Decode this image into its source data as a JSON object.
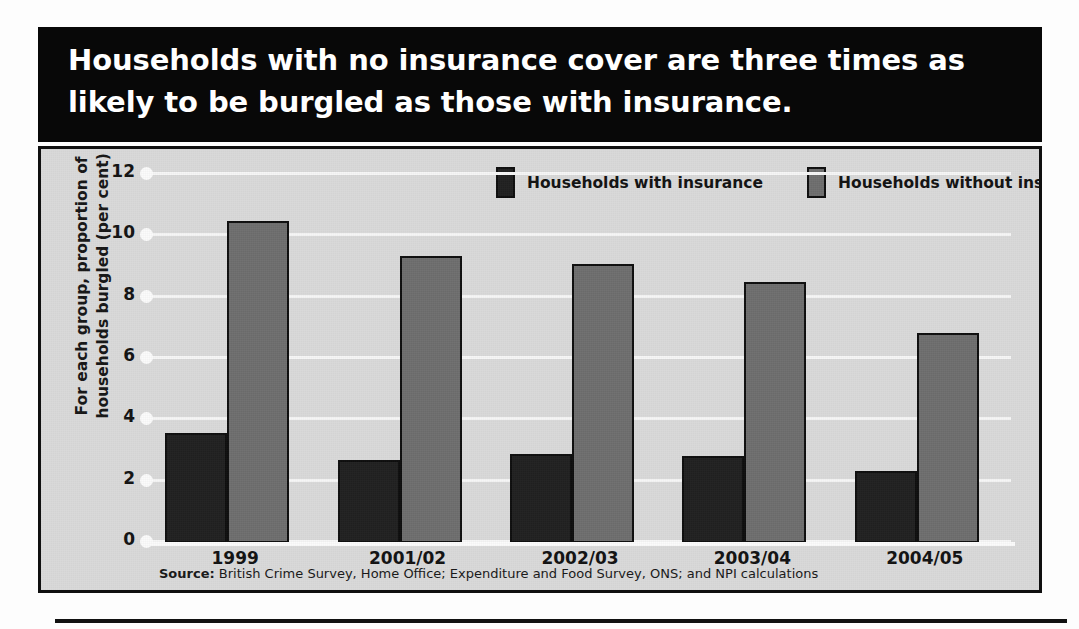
{
  "title": "Households with no insurance cover are three times as likely to be burgled as those with insurance.",
  "source": {
    "prefix": "Source:",
    "text": " British Crime Survey, Home Office; Expenditure and Food Survey, ONS; and NPI calculations"
  },
  "colors": {
    "with_insurance": "#1f1f1f",
    "without_insurance": "#6e6e6e",
    "plot_background": "#d9d9d9",
    "title_band": "#080808",
    "gridline": "#f6f6f6"
  },
  "chart_data": {
    "type": "bar",
    "title": "Households with no insurance cover are three times as likely to be burgled as those with insurance.",
    "xlabel": "",
    "ylabel": "For each group, proportion of households burgled (per cent)",
    "ylim": [
      0,
      12
    ],
    "yticks": [
      0,
      2,
      4,
      6,
      8,
      10,
      12
    ],
    "ytick_labels": [
      "0",
      "2",
      "4",
      "6",
      "8",
      "10",
      "12"
    ],
    "grid": true,
    "legend_position": "top-center",
    "categories": [
      "1999",
      "2001/02",
      "2002/03",
      "2003/04",
      "2004/05"
    ],
    "series": [
      {
        "name": "Households with insurance",
        "color": "#1f1f1f",
        "values": [
          3.6,
          2.7,
          2.9,
          2.85,
          2.35
        ]
      },
      {
        "name": "Households without insurance",
        "color": "#6e6e6e",
        "values": [
          10.5,
          9.35,
          9.1,
          8.5,
          6.85
        ]
      }
    ]
  }
}
